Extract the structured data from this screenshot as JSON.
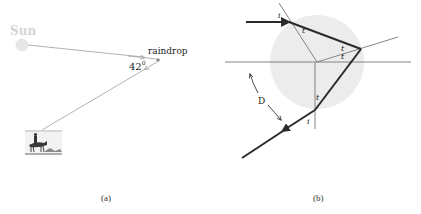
{
  "panel_a": {
    "sun_label": "Sun",
    "raindrop_label": "raindrop",
    "angle_label": "42",
    "angle_unit": "0",
    "caption": "(a)"
  },
  "panel_b": {
    "incidence_label_top": "i",
    "refraction_label_1": "t",
    "refraction_label_2": "t",
    "refraction_label_3": "t",
    "refraction_label_4": "t",
    "incidence_label_bottom": "i",
    "deviation_label": "D",
    "caption": "(b)"
  },
  "colors": {
    "sun": "#e6e6e6",
    "drop_fill": "#ececec",
    "thin_line": "#9a9a9a",
    "thick_line": "#2a2a2a"
  }
}
